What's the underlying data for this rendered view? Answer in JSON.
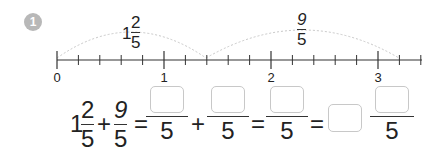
{
  "problem": {
    "number": "1",
    "badge_color": "#b8b8b8"
  },
  "number_line": {
    "labels": [
      "0",
      "1",
      "2",
      "3"
    ],
    "arc1": {
      "whole": "1",
      "numerator": "2",
      "denominator": "5"
    },
    "arc2": {
      "numerator": "9",
      "denominator": "5"
    },
    "subdivisions_per_unit": 5
  },
  "equation": {
    "term1": {
      "whole": "1",
      "numerator": "2",
      "denominator": "5"
    },
    "plus": "+",
    "term2": {
      "numerator": "9",
      "denominator": "5"
    },
    "equals": "=",
    "step1": {
      "left_denominator": "5",
      "right_denominator": "5"
    },
    "step2": {
      "denominator": "5"
    },
    "answer": {
      "denominator": "5"
    }
  }
}
